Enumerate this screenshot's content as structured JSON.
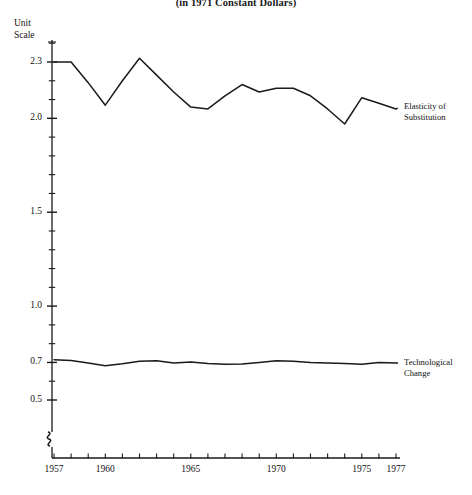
{
  "figure": {
    "subtitle": "(in 1971 Constant Dollars)",
    "unit_scale_line1": "Unit",
    "unit_scale_line2": "Scale",
    "axis_break_marker": "axis-break"
  },
  "chart_data": {
    "type": "line",
    "title": "(in 1971 Constant Dollars)",
    "xlabel": "",
    "ylabel": "Unit Scale",
    "grid": false,
    "legend_position": "right-inline",
    "xlim": [
      1957,
      1978
    ],
    "ylim": [
      0.38,
      2.42
    ],
    "yticks_labeled": [
      2.3,
      2.0,
      1.5,
      1.0,
      0.7,
      0.5
    ],
    "ytick_labels": [
      "2.3",
      "2.0",
      "1.5",
      "1.0",
      "0.7",
      "0.5"
    ],
    "yticks_minor_step": 0.1,
    "xticks_labeled": [
      1957,
      1960,
      1965,
      1970,
      1975,
      1977
    ],
    "xtick_labels": [
      "1957",
      "1960",
      "1965",
      "1970",
      "1975",
      "1977"
    ],
    "xticks_minor_step": 1,
    "x": [
      1957,
      1958,
      1959,
      1960,
      1961,
      1962,
      1963,
      1964,
      1965,
      1966,
      1967,
      1968,
      1969,
      1970,
      1971,
      1972,
      1973,
      1974,
      1975,
      1976,
      1977
    ],
    "series": [
      {
        "name": "Elasticity of Substitution",
        "label_line1": "Elasticity of",
        "label_line2": "Substitution",
        "color": "#1a1a1a",
        "values": [
          2.3,
          2.3,
          2.19,
          2.07,
          2.2,
          2.32,
          2.23,
          2.14,
          2.06,
          2.05,
          2.12,
          2.18,
          2.14,
          2.16,
          2.16,
          2.12,
          2.05,
          1.97,
          2.11,
          2.08,
          2.05
        ]
      },
      {
        "name": "Technological Change",
        "label_line1": "Technological",
        "label_line2": "Change",
        "color": "#1a1a1a",
        "values": [
          0.715,
          0.71,
          0.697,
          0.683,
          0.693,
          0.706,
          0.709,
          0.697,
          0.702,
          0.694,
          0.69,
          0.692,
          0.7,
          0.709,
          0.706,
          0.7,
          0.697,
          0.694,
          0.69,
          0.7,
          0.697
        ]
      }
    ]
  }
}
